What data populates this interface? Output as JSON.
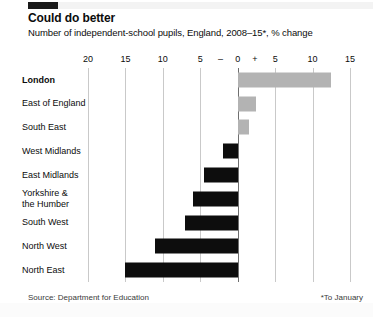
{
  "header": {
    "title": "Could do better",
    "subtitle": "Number of independent-school pupils, England, 2008–15*, % change",
    "marker_color": "#1a1a1a"
  },
  "footer": {
    "source": "Source: Department for Education",
    "footnote": "*To January"
  },
  "colors": {
    "negative_bar": "#0d0d0d",
    "positive_bar": "#b3b3b3",
    "gridline": "#c9c9c9",
    "zero_line": "#6f6f6f",
    "text": "#0c0c0c"
  },
  "chart_data": {
    "type": "bar",
    "orientation": "horizontal",
    "title": "Could do better",
    "subtitle": "Number of independent-school pupils, England, 2008–15*, % change",
    "xlabel": "",
    "ylabel": "",
    "xlim": [
      -20,
      15
    ],
    "grid": true,
    "legend": "none",
    "tick_values": [
      -20,
      -15,
      -10,
      -5,
      0,
      5,
      10,
      15
    ],
    "tick_labels": [
      "20",
      "15",
      "10",
      "5",
      "0",
      "5",
      "10",
      "15"
    ],
    "sign_markers": [
      {
        "label": "–",
        "value": -2.3
      },
      {
        "label": "+",
        "value": 2.3
      }
    ],
    "categories": [
      "London",
      "East of England",
      "South East",
      "West Midlands",
      "East Midlands",
      "Yorkshire &\nthe Humber",
      "South West",
      "North West",
      "North East"
    ],
    "values": [
      12.5,
      2.5,
      1.5,
      -2.0,
      -4.5,
      -6.0,
      -7.0,
      -11.0,
      -15.0
    ],
    "highlight_category": "London"
  }
}
